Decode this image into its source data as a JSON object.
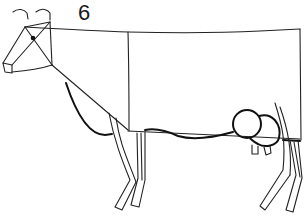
{
  "drawing": {
    "step_number": "6",
    "subject": "cow line drawing",
    "stroke_color": "#222222",
    "background_color": "#ffffff"
  }
}
